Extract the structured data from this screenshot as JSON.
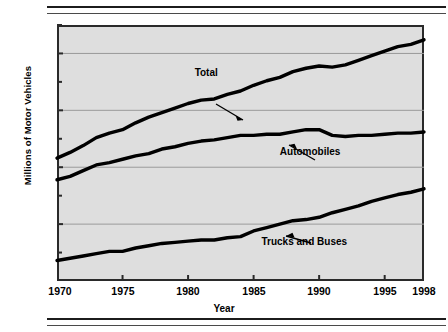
{
  "chart_data": {
    "type": "line",
    "title": "",
    "xlabel": "Year",
    "ylabel": "Millions of Motor Vehicles",
    "xlim": [
      1970,
      1998
    ],
    "ylim": [
      0,
      225
    ],
    "xticks": [
      1970,
      1975,
      1980,
      1985,
      1990,
      1995,
      1998
    ],
    "yticks": [
      0,
      50,
      100,
      150,
      200
    ],
    "y_minor_ticks": [
      25,
      75,
      125,
      175,
      225
    ],
    "grid": "horizontal",
    "legend": "inline-annotations",
    "x": [
      1970,
      1971,
      1972,
      1973,
      1974,
      1975,
      1976,
      1977,
      1978,
      1979,
      1980,
      1981,
      1982,
      1983,
      1984,
      1985,
      1986,
      1987,
      1988,
      1989,
      1990,
      1991,
      1992,
      1993,
      1994,
      1995,
      1996,
      1997,
      1998
    ],
    "series": [
      {
        "name": "Total",
        "color": "#000000",
        "values": [
          108,
          113,
          119,
          126,
          130,
          133,
          139,
          144,
          148,
          152,
          156,
          159,
          160,
          164,
          167,
          172,
          176,
          179,
          184,
          187,
          189,
          188,
          190,
          194,
          198,
          202,
          206,
          208,
          212
        ]
      },
      {
        "name": "Automobiles",
        "color": "#000000",
        "values": [
          89,
          92,
          97,
          102,
          104,
          107,
          110,
          112,
          116,
          118,
          121,
          123,
          124,
          126,
          128,
          128,
          129,
          129,
          131,
          133,
          133,
          128,
          127,
          128,
          128,
          129,
          130,
          130,
          131
        ]
      },
      {
        "name": "Trucks and Buses",
        "color": "#000000",
        "values": [
          18,
          20,
          22,
          24,
          26,
          26,
          29,
          31,
          33,
          34,
          35,
          36,
          36,
          38,
          39,
          44,
          47,
          50,
          53,
          54,
          56,
          60,
          63,
          66,
          70,
          73,
          76,
          78,
          81
        ]
      }
    ],
    "annotations": [
      {
        "text": "Total",
        "x": 1980.5,
        "y": 183
      },
      {
        "text": "Automobiles",
        "x": 1987.0,
        "y": 113
      },
      {
        "text": "Trucks and Buses",
        "x": 1985.6,
        "y": 34
      }
    ]
  },
  "axis": {
    "y_title": "Millions of Motor Vehicles",
    "x_title": "Year",
    "y_labels": [
      "200",
      "150",
      "100",
      "50",
      "0"
    ],
    "x_labels": [
      "1970",
      "1975",
      "1980",
      "1985",
      "1990",
      "1995",
      "1998"
    ]
  },
  "style": {
    "plot_background": "#dedede",
    "frame_color": "#2a2a2a",
    "grid_color": "#9a9a9a",
    "line_color": "#000000",
    "page_background": "#ffffff"
  }
}
